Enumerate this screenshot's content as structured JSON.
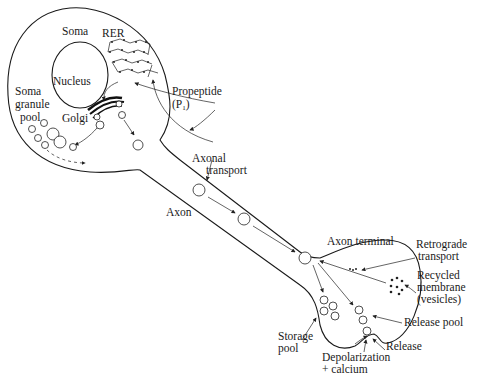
{
  "diagram": {
    "type": "neuron neuropeptide synthesis and transport",
    "labels": {
      "soma": "Soma",
      "rer": "RER",
      "nucleus": "Nucleus",
      "soma_granule_pool_1": "Soma",
      "soma_granule_pool_2": "granule",
      "soma_granule_pool_3": "pool",
      "golgi": "Golgi",
      "propeptide": "Propeptide",
      "propeptide_symbol": "(P",
      "propeptide_sub": "1",
      "propeptide_close": ")",
      "axonal_transport_1": "Axonal",
      "axonal_transport_2": "transport",
      "axon": "Axon",
      "axon_terminal": "Axon terminal",
      "retrograde_1": "Retrograde",
      "retrograde_2": "transport",
      "recycled_1": "Recycled",
      "recycled_2": "membrane",
      "recycled_3": "(vesicles)",
      "release_pool": "Release pool",
      "storage_pool_1": "Storage",
      "storage_pool_2": "pool",
      "release": "Release",
      "depolarization_1": "Depolarization",
      "depolarization_2": "+ calcium"
    },
    "colors": {
      "ink": "#1a1a1a",
      "background": "#ffffff"
    }
  }
}
